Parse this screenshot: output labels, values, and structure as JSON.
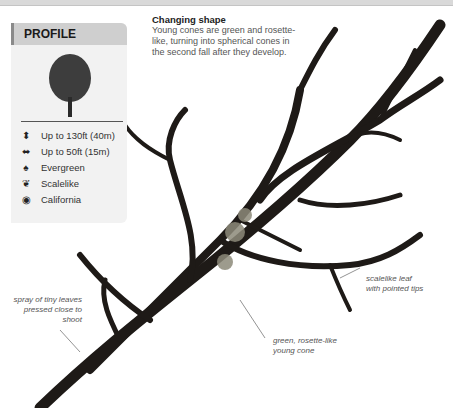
{
  "profile": {
    "title": "PROFILE",
    "facts": [
      {
        "icon": "height-arrows-icon",
        "label": "Up to 130ft (40m)"
      },
      {
        "icon": "width-arrows-icon",
        "label": "Up to 50ft (15m)"
      },
      {
        "icon": "evergreen-icon",
        "label": "Evergreen"
      },
      {
        "icon": "leaf-icon",
        "label": "Scalelike"
      },
      {
        "icon": "globe-icon",
        "label": "California"
      }
    ]
  },
  "caption": {
    "title": "Changing shape",
    "body": "Young cones are green and rosette-like, turning into spherical cones in the second fall after they develop."
  },
  "annotations": {
    "spray": "spray of tiny leaves pressed close to shoot",
    "scalelike": "scalelike leaf with pointed tips",
    "cone": "green, rosette-like young cone"
  }
}
